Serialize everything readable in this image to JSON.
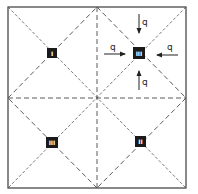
{
  "diagram": {
    "colors": {
      "line": "#3a3a3a",
      "dashed_line": "#4a4a4a",
      "marker_fill": "#1a1a1a",
      "marker_text": "#ffffff",
      "background": "#ffffff"
    },
    "outer_square": {
      "x1": 8,
      "y1": 7,
      "x2": 186,
      "y2": 188
    },
    "center": {
      "x": 97,
      "y": 97
    },
    "markers": [
      {
        "id": "top-left",
        "label": "I",
        "x": 52,
        "y": 53
      },
      {
        "id": "top-right",
        "label": "III",
        "x": 139,
        "y": 53
      },
      {
        "id": "bottom-left",
        "label": "III",
        "x": 52,
        "y": 143
      },
      {
        "id": "bottom-right",
        "label": "II",
        "x": 140,
        "y": 141
      }
    ],
    "loads": [
      {
        "id": "load-top",
        "label": "q",
        "direction": "down"
      },
      {
        "id": "load-left",
        "label": "q",
        "direction": "right"
      },
      {
        "id": "load-right",
        "label": "q",
        "direction": "left"
      },
      {
        "id": "load-bottom",
        "label": "q",
        "direction": "up"
      }
    ]
  }
}
